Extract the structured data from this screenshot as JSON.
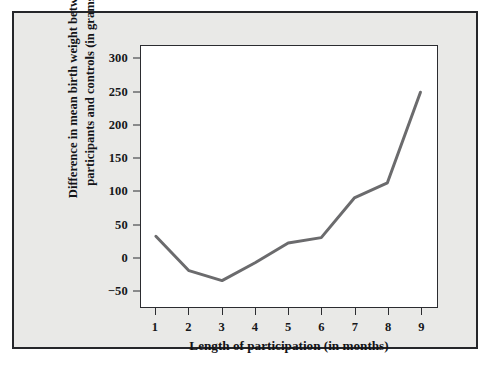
{
  "chart_data": {
    "type": "line",
    "title": "",
    "subtitle": "",
    "xlabel": "Length of participation (in months)",
    "ylabel": "Difference in mean birth weight between participants and controls (in grams)",
    "ylabel_line1": "Difference in mean birth weight between",
    "ylabel_line2": "participants and controls (in grams)",
    "x": [
      1,
      2,
      3,
      4,
      5,
      6,
      7,
      8,
      9
    ],
    "values": [
      32,
      -20,
      -35,
      -8,
      22,
      30,
      90,
      113,
      250
    ],
    "series": [
      {
        "name": "Difference in mean birth weight",
        "values": [
          32,
          -20,
          -35,
          -8,
          22,
          30,
          90,
          113,
          250
        ]
      }
    ],
    "x_tick_labels": [
      "1",
      "2",
      "3",
      "4",
      "5",
      "6",
      "7",
      "8",
      "9"
    ],
    "y_tick_labels": [
      "−50",
      "0",
      "50",
      "100",
      "150",
      "200",
      "250",
      "300"
    ],
    "y_ticks": [
      -50,
      0,
      50,
      100,
      150,
      200,
      250,
      300
    ],
    "xlim": [
      0.55,
      9.5
    ],
    "ylim": [
      -75,
      320
    ],
    "grid": false,
    "legend": false,
    "legend_position": "none",
    "markers": false,
    "line_color": "#6b6b6d",
    "line_width": 3.0,
    "plot_background": "#ffffff",
    "panel_background": "#e9e9e7",
    "axis_color": "#2b2c30",
    "text_color": "#16171a"
  }
}
